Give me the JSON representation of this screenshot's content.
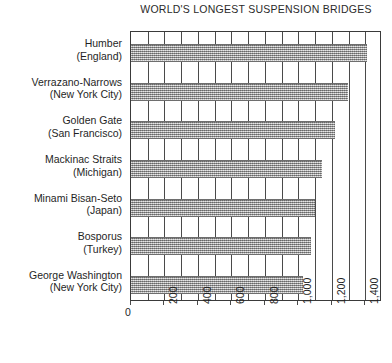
{
  "chart_data": {
    "type": "bar",
    "orientation": "horizontal",
    "title": "WORLD'S LONGEST SUSPENSION BRIDGES",
    "xlabel": "",
    "ylabel": "",
    "xlim": [
      0,
      1500
    ],
    "grid": true,
    "grid_axis": "x",
    "legend": null,
    "tick_label_rotation": -90,
    "categories": [
      "Humber (England)",
      "Verrazano-Narrows (New York City)",
      "Golden Gate (San Francisco)",
      "Mackinac Straits (Michigan)",
      "Minami Bisan-Seto (Japan)",
      "Bosporus (Turkey)",
      "George Washington (New York City)"
    ],
    "values": [
      1410,
      1298,
      1220,
      1140,
      1100,
      1074,
      1030
    ],
    "xticks": [
      0,
      200,
      400,
      600,
      800,
      1000,
      1200,
      1400
    ],
    "xticklabels": [
      "0",
      "200",
      "400",
      "600",
      "800",
      "1,000",
      "1,200",
      "1,400"
    ],
    "minor_tick_step": 100,
    "bar_fill_color": "#9a9a9a",
    "frame_color": "#3a3a3a"
  },
  "categories": [
    {
      "name": "Humber",
      "place": "(England)",
      "value": 1410
    },
    {
      "name": "Verrazano-Narrows",
      "place": "(New York City)",
      "value": 1298
    },
    {
      "name": "Golden Gate",
      "place": "(San Francisco)",
      "value": 1220
    },
    {
      "name": "Mackinac Straits",
      "place": "(Michigan)",
      "value": 1140
    },
    {
      "name": "Minami Bisan-Seto",
      "place": "(Japan)",
      "value": 1100
    },
    {
      "name": "Bosporus",
      "place": "(Turkey)",
      "value": 1074
    },
    {
      "name": "George Washington",
      "place": "(New York City)",
      "value": 1030
    }
  ]
}
